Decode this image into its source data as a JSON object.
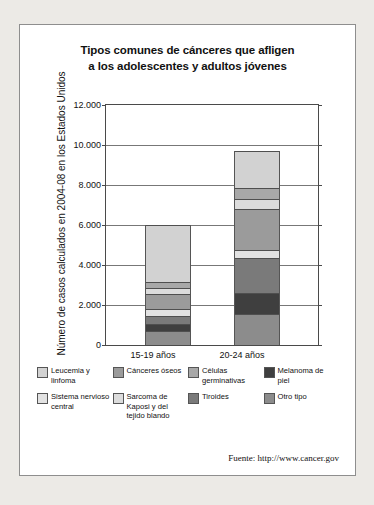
{
  "title": {
    "line1": "Tipos comunes de cánceres que afligen",
    "line2": "a los adolescentes y adultos jóvenes"
  },
  "source": "Fuente: http://www.cancer.gov",
  "chart_data": {
    "type": "bar",
    "stacked": true,
    "title": "Tipos comunes de cánceres que afligen a los adolescentes y adultos jóvenes",
    "xlabel": "",
    "ylabel": "Número de casos calculados en 2004-08 en los Estados Unidos",
    "categories": [
      "15-19 años",
      "20-24 años"
    ],
    "ylim": [
      0,
      12000
    ],
    "yticks": [
      "0",
      "2.000",
      "4.000",
      "6.000",
      "8.000",
      "10.000",
      "12.000"
    ],
    "ytick_values": [
      0,
      2000,
      4000,
      6000,
      8000,
      10000,
      12000
    ],
    "grid": true,
    "legend_position": "bottom",
    "series": [
      {
        "name": "Otro tipo",
        "color": "#8c8c8c",
        "values": [
          700,
          1550
        ]
      },
      {
        "name": "Melanoma de piel",
        "color": "#3f3f3f",
        "values": [
          350,
          1050
        ]
      },
      {
        "name": "Tiroides",
        "color": "#7a7a7a",
        "values": [
          400,
          1750
        ]
      },
      {
        "name": "Sistema nervioso central",
        "color": "#e2e2e2",
        "values": [
          350,
          400
        ]
      },
      {
        "name": "Cánceres óseos",
        "color": "#9b9b9b",
        "values": [
          750,
          2050
        ]
      },
      {
        "name": "Sarcoma de Kaposi y del tejido blando",
        "color": "#dcdcdc",
        "values": [
          300,
          500
        ]
      },
      {
        "name": "Células germinativas",
        "color": "#a8a8a8",
        "values": [
          300,
          550
        ]
      },
      {
        "name": "Leucemia y linfoma",
        "color": "#d2d2d2",
        "values": [
          2850,
          1850
        ]
      }
    ],
    "totals": [
      6000,
      9700
    ]
  },
  "legend": {
    "row1": [
      {
        "label": "Leucemia y linfoma",
        "color": "#d2d2d2"
      },
      {
        "label": "Cánceres óseos",
        "color": "#9b9b9b"
      },
      {
        "label": "Células germinativas",
        "color": "#a8a8a8"
      },
      {
        "label": "Melanoma de piel",
        "color": "#3f3f3f"
      }
    ],
    "row2": [
      {
        "label": "Sistema nervioso central",
        "color": "#e2e2e2"
      },
      {
        "label": "Sarcoma de Kaposi y del tejido blando",
        "color": "#dcdcdc"
      },
      {
        "label": "Tiroides",
        "color": "#7a7a7a"
      },
      {
        "label": "Otro tipo",
        "color": "#8c8c8c"
      }
    ]
  }
}
